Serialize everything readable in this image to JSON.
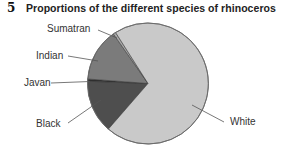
{
  "figure": {
    "number": "5",
    "title": "Proportions of the different species of rhinoceros"
  },
  "chart_data": {
    "type": "pie",
    "title": "Proportions of the different species of rhinoceros",
    "figure_number": "5",
    "categories": [
      "White",
      "Black",
      "Javan",
      "Indian",
      "Sumatran"
    ],
    "values": [
      70.4,
      14.2,
      0.6,
      14.1,
      0.7
    ],
    "unit": "percent (estimated from slice angles; no data labels shown)",
    "colors": {
      "White": "#c9c9c9",
      "Black": "#4e4e4e",
      "Javan": "#2e2e2e",
      "Indian": "#7b7b7b",
      "Sumatran": "#a9a9a9"
    },
    "labels_position": "outside with leader lines",
    "legend": "none",
    "xlabel": "",
    "ylabel": ""
  },
  "labels": {
    "sumatran": "Sumatran",
    "indian": "Indian",
    "javan": "Javan",
    "black": "Black",
    "white": "White"
  },
  "pie_layout": {
    "cx": 148,
    "cy": 83.5,
    "r": 60.5,
    "start_screen_angle_deg": 131,
    "slice_order_clockwise": [
      "Black",
      "Javan",
      "Indian",
      "Sumatran",
      "White"
    ]
  }
}
